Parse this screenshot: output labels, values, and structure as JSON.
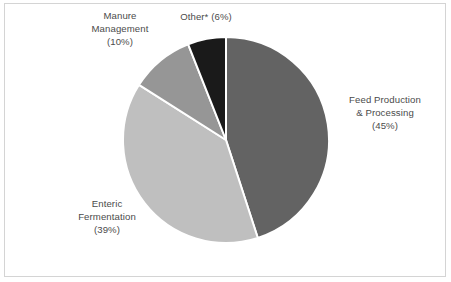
{
  "figure": {
    "background_color": "#ffffff",
    "border_color": "#d4d4d4",
    "label_color": "#4b4b4b"
  },
  "chart_data": {
    "type": "pie",
    "title": "",
    "subtitle": "",
    "xlabel": "",
    "ylabel": "",
    "legend_position": "none",
    "grid": false,
    "start_angle_deg": 0,
    "direction": "clockwise",
    "units": "percent",
    "categories": [
      "Feed Production & Processing",
      "Enteric Fermentation",
      "Manure Management",
      "Other*"
    ],
    "values": [
      45,
      39,
      10,
      6
    ],
    "colors": [
      "#636363",
      "#bfbfbf",
      "#969696",
      "#1a1a1a"
    ],
    "separator_color": "#ffffff",
    "slices": [
      {
        "name": "Feed Production & Processing",
        "value": 45,
        "percent_label": "(45%)",
        "color": "#636363",
        "label_text": "Feed Production\n& Processing\n(45%)"
      },
      {
        "name": "Enteric Fermentation",
        "value": 39,
        "percent_label": "(39%)",
        "color": "#bfbfbf",
        "label_text": "Enteric\nFermentation\n(39%)"
      },
      {
        "name": "Manure Management",
        "value": 10,
        "percent_label": "(10%)",
        "color": "#969696",
        "label_text": "Manure\nManagement\n(10%)"
      },
      {
        "name": "Other*",
        "value": 6,
        "percent_label": "(6%)",
        "color": "#1a1a1a",
        "label_text": "Other*  (6%)"
      }
    ]
  }
}
